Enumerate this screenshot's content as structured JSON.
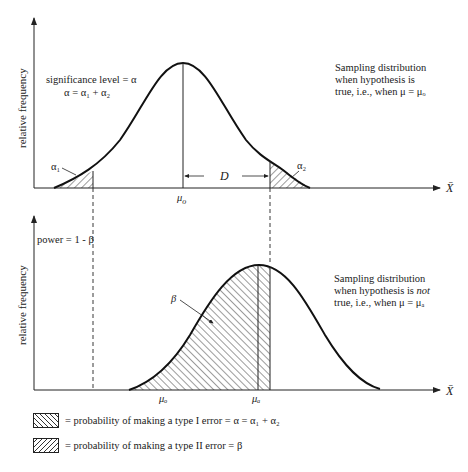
{
  "top_panel": {
    "ylabel": "relative frequency",
    "significance_line1": "significance level = α",
    "significance_line2": "α = α₁ + α₂",
    "alpha1": "α₁",
    "alpha2": "α₂",
    "mu_label": "μ",
    "mu_sub": "o",
    "D_label": "D",
    "xaxis_label": "X̄",
    "description": [
      "Sampling distribution",
      "when hypothesis is",
      "true, i.e., when μ = μₒ"
    ]
  },
  "bottom_panel": {
    "ylabel": "relative frequency",
    "power_label": "power = 1 - β",
    "beta_label": "β",
    "mu_o_label": "μₒ",
    "mu_a_label": "μₐ",
    "xaxis_label": "X̄",
    "description_line1": "Sampling distribution",
    "description_line2_a": "when hypothesis is ",
    "description_line2_b": "not",
    "description_line3": "true, i.e., when μ = μₐ"
  },
  "legend": [
    {
      "text": "=  probability of making a type I error = α = α₁ + α₂",
      "pattern": "backslash-hatch"
    },
    {
      "text": "=  probability of making a type II error = β",
      "pattern": "slash-hatch"
    }
  ],
  "colors": {
    "ink": "#1a1a1a",
    "background": "#ffffff"
  }
}
